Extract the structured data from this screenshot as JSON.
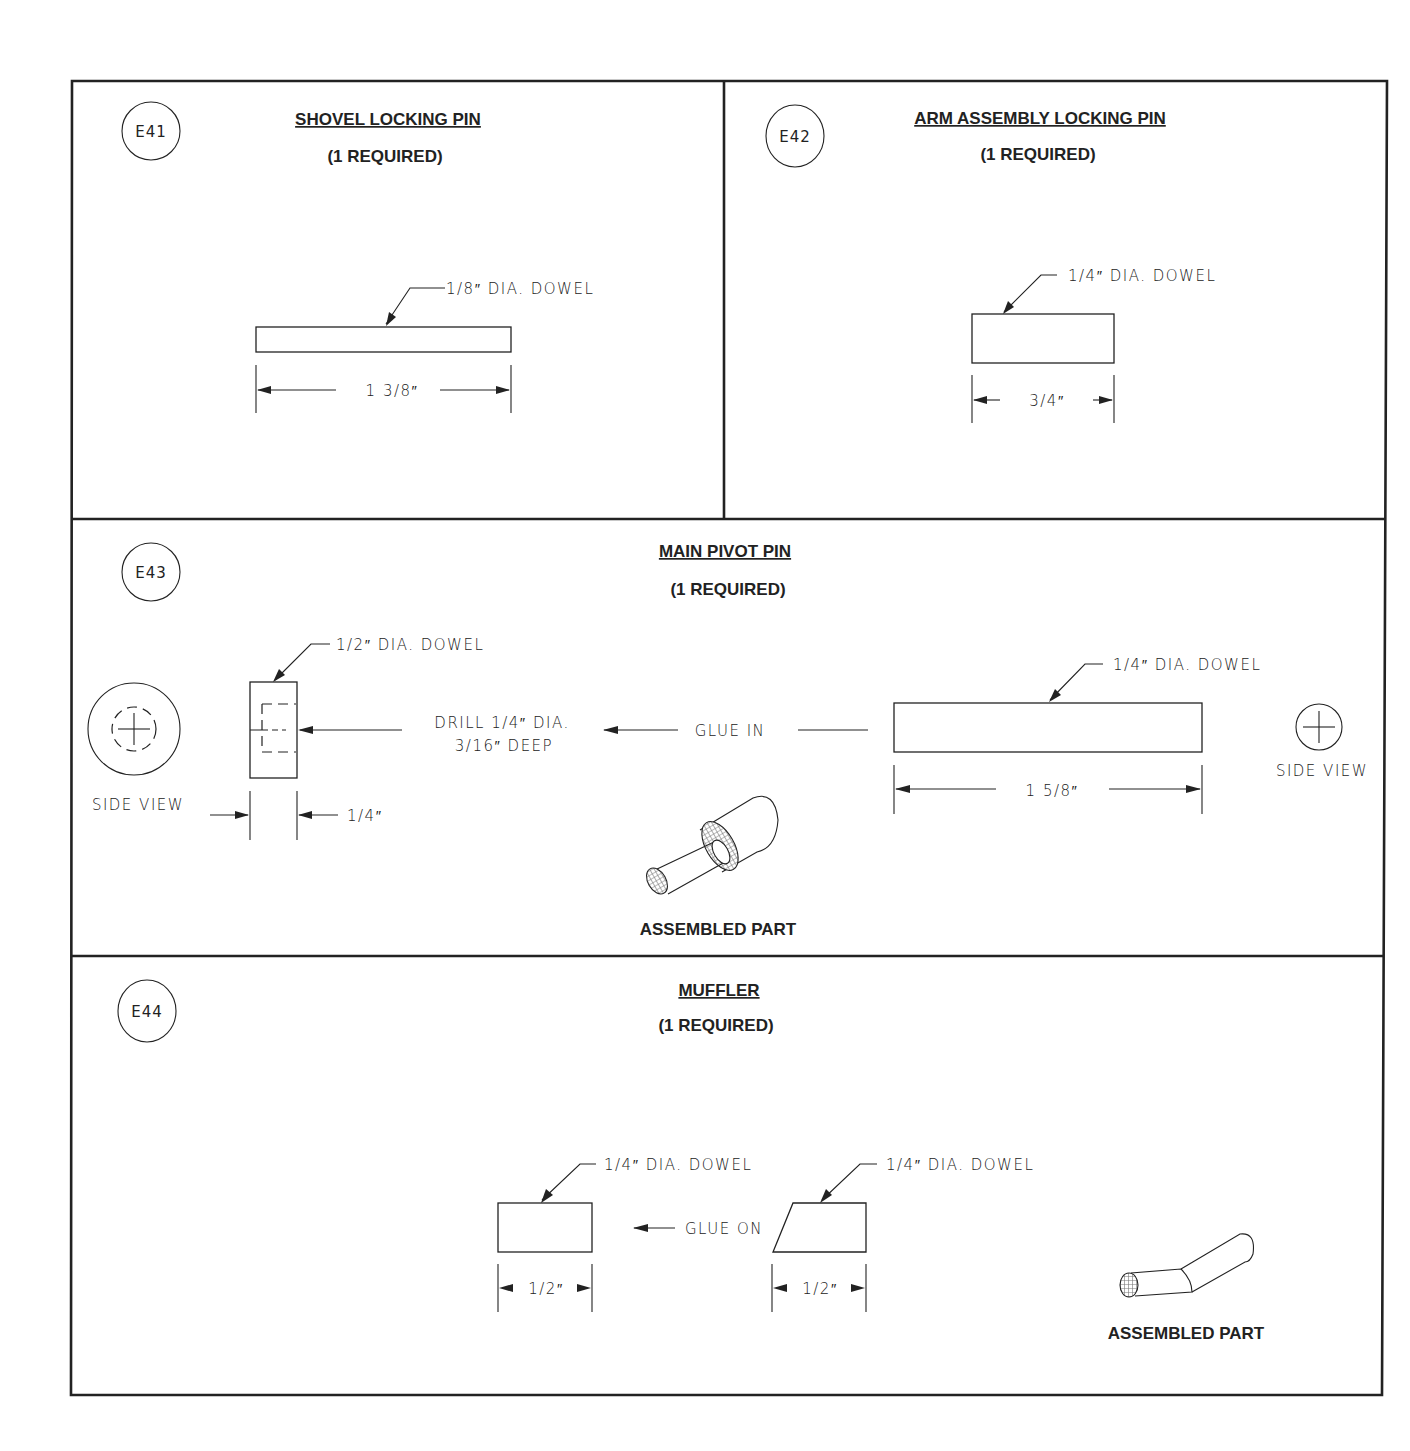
{
  "sheet": {
    "frame_color": "#222222",
    "hatch_color": "#888888",
    "panels": [
      {
        "id": "E41",
        "title": "SHOVEL LOCKING PIN",
        "quantity": "(1 REQUIRED)",
        "callouts": [
          "1/8″ DIA. DOWEL"
        ],
        "dimensions": [
          "1 3/8″"
        ]
      },
      {
        "id": "E42",
        "title": "ARM ASSEMBLY LOCKING PIN",
        "quantity": "(1 REQUIRED)",
        "callouts": [
          "1/4″ DIA. DOWEL"
        ],
        "dimensions": [
          "3/4″"
        ]
      },
      {
        "id": "E43",
        "title": "MAIN PIVOT PIN",
        "quantity": "(1 REQUIRED)",
        "callouts": [
          "1/2″ DIA. DOWEL",
          "1/4″ DIA. DOWEL"
        ],
        "notes": {
          "drill_line1": "DRILL 1/4″ DIA.",
          "drill_line2": "3/16″ DEEP",
          "glue": "GLUE IN",
          "side_view_left": "SIDE VIEW",
          "side_view_right": "SIDE VIEW"
        },
        "dimensions": [
          "1/4″",
          "1 5/8″"
        ],
        "assembled_label": "ASSEMBLED PART"
      },
      {
        "id": "E44",
        "title": "MUFFLER",
        "quantity": "(1 REQUIRED)",
        "callouts": [
          "1/4″ DIA. DOWEL",
          "1/4″ DIA. DOWEL"
        ],
        "notes": {
          "glue": "GLUE ON"
        },
        "dimensions": [
          "1/2″",
          "1/2″"
        ],
        "assembled_label": "ASSEMBLED PART"
      }
    ]
  }
}
